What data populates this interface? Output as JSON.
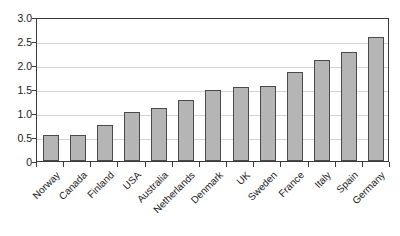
{
  "chart_data": {
    "type": "bar",
    "title": "",
    "subtitle": "",
    "xlabel": "",
    "ylabel": "",
    "categories": [
      "Norway",
      "Canada",
      "Finland",
      "USA",
      "Australia",
      "Netherlands",
      "Denmark",
      "UK",
      "Sweden",
      "France",
      "Italy",
      "Spain",
      "Germany"
    ],
    "values": [
      0.55,
      0.55,
      0.75,
      1.02,
      1.1,
      1.27,
      1.48,
      1.54,
      1.56,
      1.85,
      2.1,
      2.27,
      2.59
    ],
    "ylim": [
      0,
      3.0
    ],
    "ytick_labels": [
      "3.0",
      "2.5",
      "2.0",
      "1.5",
      "1.0",
      "0.5",
      "0"
    ],
    "ytick_values": [
      3.0,
      2.5,
      2.0,
      1.5,
      1.0,
      0.5,
      0
    ],
    "grid": true,
    "legend": false,
    "legend_position": "none",
    "series": [
      {
        "name": "",
        "values": [
          0.55,
          0.55,
          0.75,
          1.02,
          1.1,
          1.27,
          1.48,
          1.54,
          1.56,
          1.85,
          2.1,
          2.27,
          2.59
        ]
      }
    ],
    "colors": {
      "bar_fill": "#b5b5b5",
      "bar_border": "#4a4a4a",
      "gridline": "#d4d4d4",
      "axis": "#3a3a3a",
      "text": "#1a1a1a",
      "background": "#ffffff"
    }
  }
}
